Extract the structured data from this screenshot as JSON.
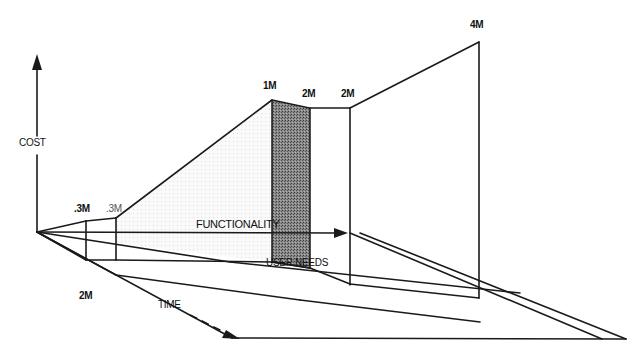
{
  "diagram": {
    "axes": {
      "cost": "COST",
      "time": "TIME",
      "functionality": "FUNCTIONALITY",
      "user_needs": "USER NEEDS"
    },
    "cost_labels": {
      "c1": ".3M",
      "c2": ".3M",
      "c3": "1M",
      "c4": "2M",
      "c5": "2M",
      "c6": "4M"
    },
    "time_label_value": "2M",
    "colors": {
      "line": "#1a1a1a",
      "shaded_band": "#6e6e6e",
      "light_fill": "#f2f2f2",
      "background": "#ffffff"
    }
  }
}
